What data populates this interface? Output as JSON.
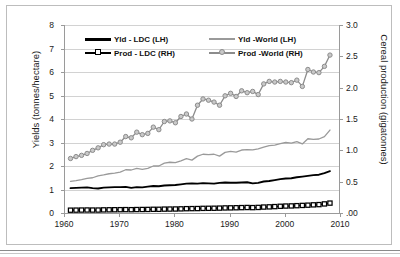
{
  "chart_data": {
    "type": "line",
    "title": "",
    "xlabel": "",
    "ylabel": "Yields (tonnes/hectare)",
    "y2label": "Cereal production (gigatonnes)",
    "xlim": [
      1960,
      2010
    ],
    "ylim": [
      0,
      8
    ],
    "y2lim": [
      0.0,
      3.0
    ],
    "grid": true,
    "legend_position": "top-inside",
    "xticks": [
      1960,
      1970,
      1980,
      1990,
      2000,
      2010
    ],
    "xtick_labels": [
      "1960",
      "1970",
      "1980",
      "1990",
      "2000",
      "2010"
    ],
    "yticks": [
      0,
      1,
      2,
      3,
      4,
      5,
      6,
      7,
      8
    ],
    "ytick_labels": [
      "0",
      "1",
      "2",
      "3",
      "4",
      "5",
      "6",
      "7",
      "8"
    ],
    "y2ticks": [
      0.0,
      0.5,
      1.0,
      1.5,
      2.0,
      2.5,
      3.0
    ],
    "y2tick_labels": [
      ".00",
      "0.5",
      "1.0",
      "1.5",
      "2.0",
      "2.5",
      "3.0"
    ],
    "x": [
      1961,
      1962,
      1963,
      1964,
      1965,
      1966,
      1967,
      1968,
      1969,
      1970,
      1971,
      1972,
      1973,
      1974,
      1975,
      1976,
      1977,
      1978,
      1979,
      1980,
      1981,
      1982,
      1983,
      1984,
      1985,
      1986,
      1987,
      1988,
      1989,
      1990,
      1991,
      1992,
      1993,
      1994,
      1995,
      1996,
      1997,
      1998,
      1999,
      2000,
      2001,
      2002,
      2003,
      2004,
      2005,
      2006,
      2007,
      2008
    ],
    "series": [
      {
        "name": "Yld - LDC (LH)",
        "axis": "left",
        "units": "tonnes/hectare",
        "color": "#000000",
        "marker": "none",
        "values": [
          1.06,
          1.07,
          1.08,
          1.09,
          1.06,
          1.04,
          1.08,
          1.09,
          1.1,
          1.1,
          1.11,
          1.07,
          1.1,
          1.09,
          1.12,
          1.15,
          1.14,
          1.17,
          1.18,
          1.19,
          1.22,
          1.25,
          1.26,
          1.25,
          1.27,
          1.26,
          1.25,
          1.28,
          1.3,
          1.29,
          1.29,
          1.3,
          1.31,
          1.26,
          1.28,
          1.34,
          1.36,
          1.4,
          1.44,
          1.47,
          1.48,
          1.52,
          1.55,
          1.58,
          1.61,
          1.63,
          1.7,
          1.78
        ]
      },
      {
        "name": "Yld - World (LH)",
        "axis": "left",
        "units": "tonnes/hectare",
        "color": "#9a9a9a",
        "marker": "none",
        "values": [
          1.35,
          1.38,
          1.42,
          1.47,
          1.5,
          1.58,
          1.62,
          1.67,
          1.7,
          1.74,
          1.84,
          1.83,
          1.9,
          1.86,
          1.9,
          2.0,
          2.0,
          2.12,
          2.16,
          2.14,
          2.22,
          2.31,
          2.25,
          2.42,
          2.5,
          2.48,
          2.5,
          2.42,
          2.58,
          2.62,
          2.59,
          2.68,
          2.7,
          2.69,
          2.73,
          2.8,
          2.87,
          2.89,
          2.95,
          3.0,
          2.97,
          3.04,
          2.94,
          3.16,
          3.13,
          3.15,
          3.25,
          3.53
        ]
      },
      {
        "name": "Prod - LDC (RH)",
        "axis": "right",
        "units": "gigatonnes",
        "color": "#000000",
        "marker": "square",
        "values": [
          0.045,
          0.046,
          0.047,
          0.048,
          0.047,
          0.047,
          0.05,
          0.051,
          0.052,
          0.053,
          0.054,
          0.053,
          0.055,
          0.056,
          0.057,
          0.059,
          0.059,
          0.062,
          0.063,
          0.064,
          0.066,
          0.069,
          0.07,
          0.071,
          0.074,
          0.075,
          0.076,
          0.078,
          0.081,
          0.082,
          0.084,
          0.086,
          0.088,
          0.086,
          0.089,
          0.095,
          0.098,
          0.102,
          0.107,
          0.111,
          0.113,
          0.117,
          0.121,
          0.125,
          0.13,
          0.134,
          0.145,
          0.158
        ]
      },
      {
        "name": "Prod - World (RH)",
        "axis": "right",
        "units": "gigatonnes",
        "color": "#8c8c8c",
        "marker": "circle",
        "values": [
          0.87,
          0.9,
          0.92,
          0.95,
          1.0,
          1.04,
          1.09,
          1.1,
          1.1,
          1.13,
          1.22,
          1.2,
          1.29,
          1.25,
          1.27,
          1.37,
          1.33,
          1.46,
          1.47,
          1.44,
          1.54,
          1.58,
          1.5,
          1.72,
          1.82,
          1.8,
          1.77,
          1.72,
          1.87,
          1.91,
          1.86,
          1.95,
          1.92,
          1.94,
          1.89,
          2.06,
          2.1,
          2.09,
          2.1,
          2.09,
          2.08,
          2.12,
          2.02,
          2.29,
          2.25,
          2.24,
          2.34,
          2.52
        ]
      }
    ]
  },
  "legend": {
    "items": [
      {
        "label": "Yld - LDC (LH)",
        "color": "#000000",
        "marker": "none",
        "weight": "3"
      },
      {
        "label": "Yld -World (LH)",
        "color": "#9a9a9a",
        "marker": "none",
        "weight": "2"
      },
      {
        "label": "Prod - LDC (RH)",
        "color": "#000000",
        "marker": "square",
        "weight": "2"
      },
      {
        "label": "Prod -World (RH)",
        "color": "#8c8c8c",
        "marker": "circle",
        "weight": "2"
      }
    ]
  }
}
